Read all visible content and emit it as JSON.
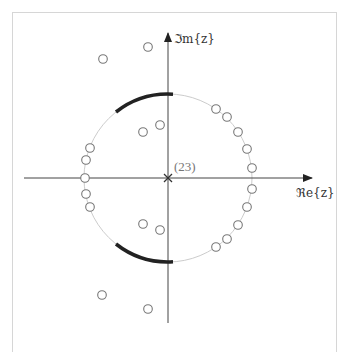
{
  "diagram": {
    "axes": {
      "x_label": "ℜe{z}",
      "y_label": "ℑm{z}",
      "origin_px": [
        168,
        178
      ],
      "unit_circle_radius_px": 84
    },
    "origin_marker": {
      "type": "pole",
      "symbol": "×",
      "multiplicity_label": "(23)"
    },
    "zeros_px": [
      [
        148,
        47
      ],
      [
        103,
        59
      ],
      [
        216,
        109
      ],
      [
        227,
        117
      ],
      [
        238,
        132
      ],
      [
        247,
        149
      ],
      [
        252,
        168
      ],
      [
        252,
        189
      ],
      [
        247,
        207
      ],
      [
        238,
        225
      ],
      [
        227,
        239
      ],
      [
        216,
        247
      ],
      [
        90,
        148
      ],
      [
        86,
        160
      ],
      [
        85,
        178
      ],
      [
        86,
        194
      ],
      [
        90,
        207
      ],
      [
        143,
        132
      ],
      [
        160,
        125
      ],
      [
        143,
        224
      ],
      [
        160,
        230
      ],
      [
        102,
        295
      ],
      [
        148,
        309
      ]
    ],
    "highlighted_arcs": [
      {
        "name": "upper-arc",
        "from_px": [
          116,
          113
        ],
        "to_px": [
          173,
          94
        ]
      },
      {
        "name": "lower-arc",
        "from_px": [
          116,
          243
        ],
        "to_px": [
          173,
          262
        ]
      }
    ],
    "colors": {
      "axis": "#444444",
      "unit_circle": "#cccccc",
      "zero_stroke": "#777777",
      "arc": "#222222",
      "frame": "#d6d6d6"
    }
  }
}
